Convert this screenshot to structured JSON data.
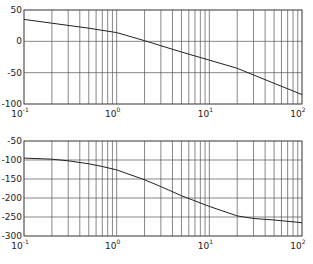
{
  "chart_data": [
    {
      "type": "line",
      "title": "",
      "xlabel": "",
      "ylabel": "",
      "xscale": "log",
      "xlim": [
        0.1,
        100
      ],
      "ylim": [
        -100,
        50
      ],
      "grid": true,
      "yticks": [
        50,
        0,
        -50,
        -100
      ],
      "ytick_labels": [
        "50",
        "0",
        "-50",
        "-100"
      ],
      "xtick_labels": [
        "10^-1",
        "10^0",
        "10^1",
        "10^2"
      ],
      "series": [
        {
          "name": "magnitude",
          "x": [
            0.1,
            0.2,
            0.5,
            1,
            2,
            5,
            10,
            20,
            50,
            100
          ],
          "y": [
            35,
            29,
            21,
            14,
            1,
            -17,
            -30,
            -43,
            -67,
            -85
          ]
        }
      ]
    },
    {
      "type": "line",
      "title": "",
      "xlabel": "",
      "ylabel": "",
      "xscale": "log",
      "xlim": [
        0.1,
        100
      ],
      "ylim": [
        -300,
        -50
      ],
      "grid": true,
      "yticks": [
        -50,
        -100,
        -150,
        -200,
        -250,
        -300
      ],
      "ytick_labels": [
        "-50",
        "-100",
        "-150",
        "-200",
        "-250",
        "-300"
      ],
      "xtick_labels": [
        "10^-1",
        "10^0",
        "10^1",
        "10^2"
      ],
      "series": [
        {
          "name": "phase",
          "x": [
            0.1,
            0.2,
            0.3,
            0.5,
            0.7,
            1,
            2,
            3,
            5,
            10,
            20,
            30,
            50,
            100
          ],
          "y": [
            -95,
            -98,
            -102,
            -110,
            -117,
            -126,
            -152,
            -170,
            -194,
            -222,
            -247,
            -254,
            -258,
            -265
          ]
        }
      ]
    }
  ]
}
